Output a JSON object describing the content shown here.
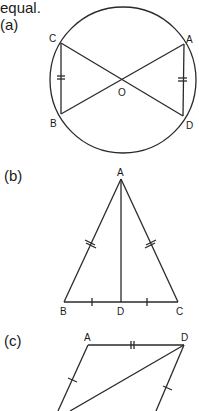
{
  "intro_text": "equal.",
  "figures": [
    {
      "label": "(a)",
      "points": {
        "C": "C",
        "A": "A",
        "B": "B",
        "D": "D",
        "O": "O"
      },
      "description": "Circle with centre O; chords CD and AB cross at O; CB and AD marked equal (double ticks)"
    },
    {
      "label": "(b)",
      "points": {
        "A": "A",
        "B": "B",
        "D": "D",
        "C": "C"
      },
      "description": "Isosceles triangle ABC with AB = AC (double ticks), AD perpendicular bisector, BD = DC (single ticks)"
    },
    {
      "label": "(c)",
      "points": {
        "A": "A",
        "D": "D"
      },
      "description": "Quadrilateral with AD marked (double tick), opposite sides marked equal (single ticks), diagonal from D"
    }
  ]
}
